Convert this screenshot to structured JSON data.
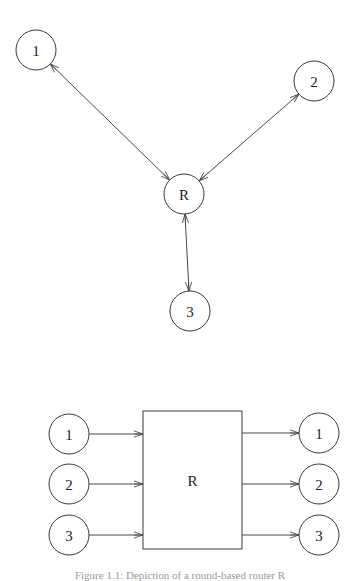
{
  "top_diagram": {
    "nodes": [
      {
        "id": "1",
        "label": "1",
        "cx": 36,
        "cy": 50,
        "r": 20
      },
      {
        "id": "2",
        "label": "2",
        "cx": 314,
        "cy": 81,
        "r": 20
      },
      {
        "id": "R",
        "label": "R",
        "cx": 184,
        "cy": 194,
        "r": 20
      },
      {
        "id": "3",
        "label": "3",
        "cx": 190,
        "cy": 311,
        "r": 20
      }
    ],
    "edges": [
      {
        "from": "1",
        "to": "R",
        "bidirectional": true
      },
      {
        "from": "2",
        "to": "R",
        "bidirectional": true
      },
      {
        "from": "R",
        "to": "3",
        "bidirectional": true
      }
    ]
  },
  "bottom_diagram": {
    "box": {
      "label": "R",
      "x": 143,
      "y": 411,
      "width": 99,
      "height": 138
    },
    "inputs": [
      {
        "label": "1",
        "cx": 69,
        "cy": 434,
        "r": 20
      },
      {
        "label": "2",
        "cx": 69,
        "cy": 484,
        "r": 20
      },
      {
        "label": "3",
        "cx": 69,
        "cy": 535,
        "r": 20
      }
    ],
    "outputs": [
      {
        "label": "1",
        "cx": 319,
        "cy": 433,
        "r": 20
      },
      {
        "label": "2",
        "cx": 319,
        "cy": 484,
        "r": 20
      },
      {
        "label": "3",
        "cx": 319,
        "cy": 535,
        "r": 20
      }
    ]
  },
  "caption": "Figure 1.1: Depiction of a round-based router R"
}
